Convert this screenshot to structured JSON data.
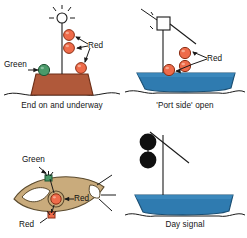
{
  "figure": {
    "title_visible": false,
    "type": "nautical-navigation-lights-diagram",
    "panel_count": 4
  },
  "colors": {
    "red_light": "#ef6b4a",
    "red_light_stroke": "#8c2f14",
    "green_light": "#4a9a6a",
    "green_light_stroke": "#1d5434",
    "hull_brown": "#b0593a",
    "hull_brown_stroke": "#6d2f18",
    "hull_blue": "#2f7bb0",
    "hull_blue_stroke": "#1b4f73",
    "plan_tan": "#c9ab7c",
    "plan_tan_stroke": "#5a4a2e",
    "black_shape": "#101010",
    "line": "#1a1a1a",
    "text": "#151515",
    "water": "#1a1a1a",
    "background": "#ffffff"
  },
  "panels": [
    {
      "id": "end-on-underway",
      "caption": "End on and underway",
      "view": "bow-on elevation",
      "hull_color": "#b0593a",
      "masthead_symbol": "light-with-rays",
      "lights": [
        {
          "name": "green-sidelight",
          "color": "green",
          "label": "Green",
          "side": "left"
        },
        {
          "name": "red-light-upper",
          "color": "red",
          "label": "Red",
          "side": "mast-right"
        },
        {
          "name": "red-light-middle",
          "color": "red",
          "label": "Red",
          "side": "mast-right"
        },
        {
          "name": "red-sidelight",
          "color": "red",
          "label": "Red",
          "side": "right"
        }
      ],
      "labels": [
        {
          "text": "Green",
          "for": "green-sidelight"
        },
        {
          "text": "Red",
          "for": "red-lights"
        }
      ]
    },
    {
      "id": "port-side-open",
      "caption": "'Port side' open",
      "view": "port beam elevation",
      "hull_color": "#2f7bb0",
      "masthead_symbol": "square-shape",
      "lights": [
        {
          "name": "red-light-top",
          "color": "red",
          "label": "Red"
        },
        {
          "name": "red-light-middle",
          "color": "red",
          "label": "Red"
        },
        {
          "name": "red-light-low",
          "color": "red",
          "label": "Red"
        }
      ],
      "labels": [
        {
          "text": "Red",
          "for": "red-lights"
        }
      ]
    },
    {
      "id": "plan-view",
      "caption": "",
      "view": "overhead plan",
      "hull_color": "#c9ab7c",
      "lights": [
        {
          "name": "green-sidelight",
          "color": "green",
          "label": "Green"
        },
        {
          "name": "red-all-round-light",
          "color": "red",
          "label": "Red"
        },
        {
          "name": "red-sidelight",
          "color": "red",
          "label": "Red"
        }
      ],
      "labels": [
        {
          "text": "Green",
          "for": "green-sidelight"
        },
        {
          "text": "Red",
          "for": "red-all-round-light"
        },
        {
          "text": "Red",
          "for": "red-sidelight"
        }
      ]
    },
    {
      "id": "day-signal",
      "caption": "Day signal",
      "view": "port beam elevation",
      "hull_color": "#2f7bb0",
      "shapes": [
        {
          "name": "black-ball-upper",
          "color": "black",
          "form": "ball"
        },
        {
          "name": "black-ball-lower",
          "color": "black",
          "form": "ball"
        }
      ],
      "labels": []
    }
  ],
  "label_text": {
    "green": "Green",
    "red": "Red"
  },
  "captions": {
    "panel1": "End on and underway",
    "panel2": "'Port side' open",
    "panel4": "Day signal"
  }
}
